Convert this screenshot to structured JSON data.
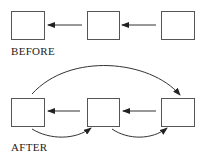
{
  "before": {
    "label": "BEFORE",
    "nodes": [
      {
        "id": "b1",
        "x": 11,
        "y": 11,
        "w": 33,
        "h": 28
      },
      {
        "id": "b2",
        "x": 87,
        "y": 11,
        "w": 32,
        "h": 28
      },
      {
        "id": "b3",
        "x": 161,
        "y": 11,
        "w": 33,
        "h": 28
      }
    ],
    "edges": [
      {
        "from": "b2",
        "to": "b1",
        "type": "straight"
      },
      {
        "from": "b3",
        "to": "b2",
        "type": "straight"
      }
    ]
  },
  "after": {
    "label": "AFTER",
    "nodes": [
      {
        "id": "a1",
        "x": 11,
        "y": 98,
        "w": 33,
        "h": 28
      },
      {
        "id": "a2",
        "x": 87,
        "y": 98,
        "w": 32,
        "h": 28
      },
      {
        "id": "a3",
        "x": 161,
        "y": 98,
        "w": 33,
        "h": 28
      }
    ],
    "edges": [
      {
        "from": "a2",
        "to": "a1",
        "type": "straight"
      },
      {
        "from": "a3",
        "to": "a2",
        "type": "straight"
      },
      {
        "from": "a1",
        "to": "a3",
        "type": "curved-over"
      },
      {
        "from": "a1",
        "to": "a2",
        "type": "curved-under"
      },
      {
        "from": "a2",
        "to": "a3",
        "type": "curved-under"
      }
    ]
  },
  "colors": {
    "stroke": "#333333",
    "fill": "#ffffff"
  }
}
